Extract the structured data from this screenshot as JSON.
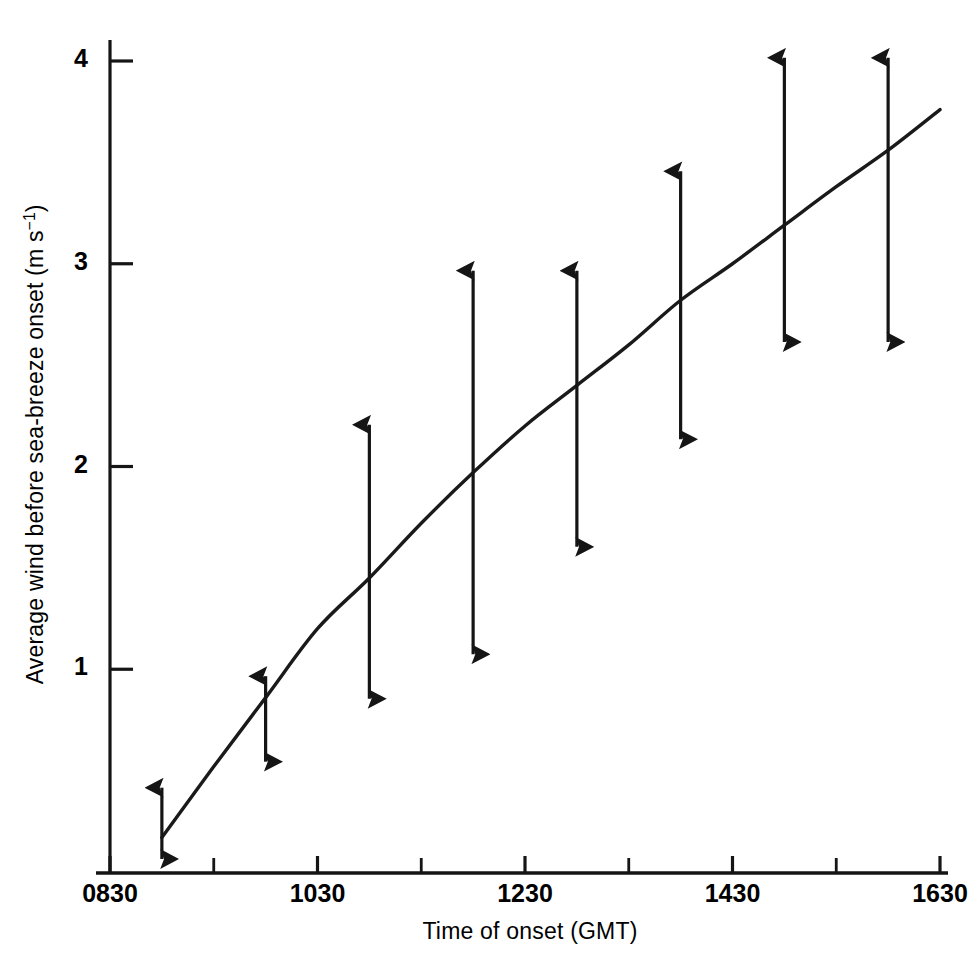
{
  "chart_data": {
    "type": "line",
    "title": "",
    "xlabel": "Time of onset (GMT)",
    "ylabel": "Average wind before sea-breeze onset (m s",
    "ylabel_sup": "−1",
    "ylabel_suffix": ")",
    "grid": false,
    "legend": "none",
    "xlim": [
      830,
      1630
    ],
    "ylim": [
      0,
      4.15
    ],
    "x_tick_labels": [
      "0830",
      "1030",
      "1230",
      "1430",
      "1630"
    ],
    "x_tick_values": [
      830,
      1030,
      1230,
      1430,
      1630
    ],
    "x_minor_tick_values": [
      930,
      1130,
      1330,
      1530
    ],
    "y_tick_labels": [
      "1",
      "2",
      "3",
      "4"
    ],
    "y_tick_values": [
      1,
      2,
      3,
      4
    ],
    "series": [
      {
        "name": "fitted curve",
        "kind": "line",
        "x": [
          900,
          930,
          1000,
          1030,
          1100,
          1130,
          1200,
          1230,
          1300,
          1330,
          1400,
          1430,
          1500,
          1530,
          1600,
          1630
        ],
        "y": [
          0.17,
          0.52,
          0.86,
          1.2,
          1.45,
          1.72,
          1.97,
          2.2,
          2.4,
          2.6,
          2.82,
          3.0,
          3.19,
          3.38,
          3.56,
          3.76
        ]
      },
      {
        "name": "spread of observations (double-headed arrows)",
        "kind": "errorbar",
        "points": [
          {
            "x": 900,
            "x_label": "0900",
            "low": 0.0,
            "high": 0.48,
            "centre": 0.17
          },
          {
            "x": 1000,
            "x_label": "1000",
            "low": 0.48,
            "high": 1.03,
            "centre": 0.86
          },
          {
            "x": 1100,
            "x_label": "1100",
            "low": 0.79,
            "high": 2.27,
            "centre": 1.45
          },
          {
            "x": 1200,
            "x_label": "1200",
            "low": 1.01,
            "high": 3.03,
            "centre": 1.97
          },
          {
            "x": 1300,
            "x_label": "1300",
            "low": 1.54,
            "high": 3.03,
            "centre": 2.4
          },
          {
            "x": 1400,
            "x_label": "1400",
            "low": 2.07,
            "high": 3.52,
            "centre": 2.82
          },
          {
            "x": 1500,
            "x_label": "1500",
            "low": 2.55,
            "high": 4.08,
            "centre": 3.19
          },
          {
            "x": 1600,
            "x_label": "1600",
            "low": 2.55,
            "high": 4.08,
            "centre": 3.56
          }
        ]
      }
    ],
    "colors": {
      "line": "#1a1a1a",
      "axis": "#111111",
      "background": "#ffffff"
    }
  }
}
